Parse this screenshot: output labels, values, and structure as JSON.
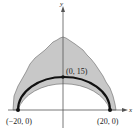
{
  "figure": {
    "axes": {
      "x_label": "x",
      "y_label": "y"
    },
    "points": [
      {
        "label": "(−20, 0)",
        "x": -20,
        "y": 0
      },
      {
        "label": "(0, 15)",
        "x": 0,
        "y": 15
      },
      {
        "label": "(20, 0)",
        "x": 20,
        "y": 0
      }
    ],
    "curve": "semi-ellipse arch through (−20, 0), (0, 15), (20, 0)",
    "region": "shaded irregular region above the arch",
    "colors": {
      "shade": "#c8c8c8",
      "curve": "#111111",
      "axis": "#555555"
    }
  }
}
